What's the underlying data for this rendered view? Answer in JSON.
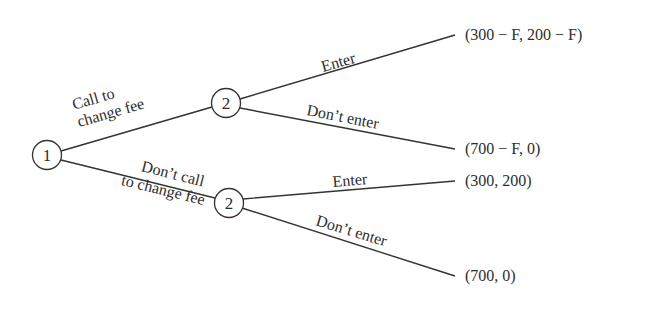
{
  "diagram": {
    "type": "game-tree",
    "colors": {
      "ink": "#333333",
      "background": "#ffffff"
    },
    "nodes": {
      "root": {
        "player": "1"
      },
      "upper": {
        "player": "2"
      },
      "lower": {
        "player": "2"
      }
    },
    "player1_actions": {
      "call": {
        "line1": "Call to",
        "line2": "change fee"
      },
      "dont_call": {
        "line1": "Don’t call",
        "line2": "to change fee"
      }
    },
    "player2_actions": {
      "upper_enter": "Enter",
      "upper_dont_enter": "Don’t enter",
      "lower_enter": "Enter",
      "lower_dont_enter": "Don’t enter"
    },
    "payoffs": {
      "call_enter": "(300 − F, 200 − F)",
      "call_dont_enter": "(700 − F, 0)",
      "dontcall_enter": "(300, 200)",
      "dontcall_dont_enter": "(700, 0)"
    }
  }
}
